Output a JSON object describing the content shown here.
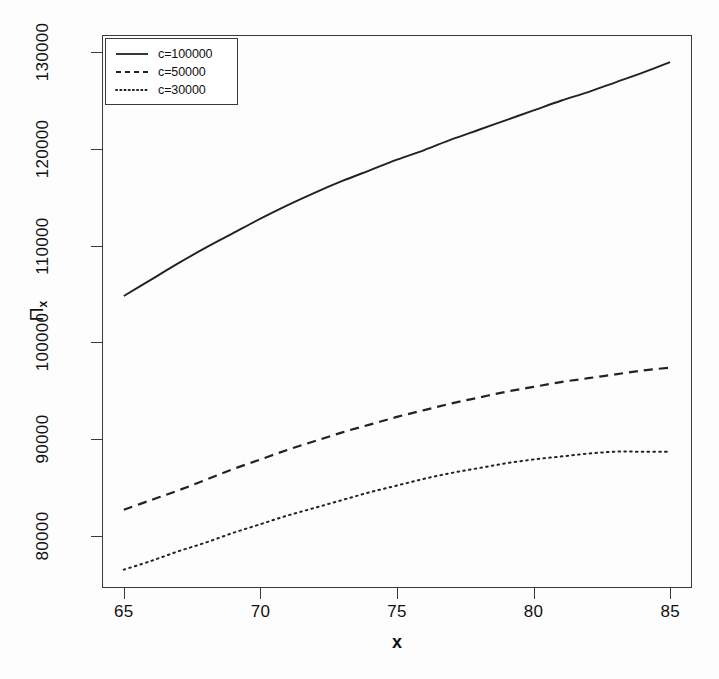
{
  "chart_data": {
    "type": "line",
    "title": "",
    "subtitle": "",
    "xlabel": "x",
    "ylabel": "Π",
    "ylabel_subscript": "x",
    "xlim": [
      64.2,
      85.8
    ],
    "ylim": [
      74600,
      131800
    ],
    "xticks": [
      65,
      70,
      75,
      80,
      85
    ],
    "yticks": [
      80000,
      90000,
      100000,
      110000,
      120000,
      130000
    ],
    "xtick_labels": [
      "65",
      "70",
      "75",
      "80",
      "85"
    ],
    "ytick_labels": [
      "80000",
      "90000",
      "100000",
      "110000",
      "120000",
      "130000"
    ],
    "grid": false,
    "legend_position": "top-left",
    "x": [
      65,
      66,
      67,
      68,
      69,
      70,
      71,
      72,
      73,
      74,
      75,
      76,
      77,
      78,
      79,
      80,
      81,
      82,
      83,
      84,
      85
    ],
    "series": [
      {
        "name": "c=100000",
        "label": "c=100000",
        "style": "solid",
        "color": "#222222",
        "values": [
          104800,
          106500,
          108200,
          109800,
          111300,
          112800,
          114200,
          115500,
          116700,
          117800,
          118900,
          119900,
          121000,
          122000,
          123000,
          124000,
          125000,
          125900,
          126900,
          127900,
          129000
        ]
      },
      {
        "name": "c=50000",
        "label": "c=50000",
        "style": "dashed",
        "color": "#222222",
        "values": [
          82700,
          83700,
          84700,
          85800,
          86900,
          87900,
          88900,
          89800,
          90700,
          91500,
          92300,
          93000,
          93700,
          94300,
          94900,
          95400,
          95900,
          96300,
          96700,
          97100,
          97400
        ]
      },
      {
        "name": "c=30000",
        "label": "c=30000",
        "style": "dotted",
        "color": "#222222",
        "values": [
          76500,
          77400,
          78400,
          79300,
          80300,
          81200,
          82100,
          82900,
          83700,
          84500,
          85200,
          85900,
          86500,
          87000,
          87500,
          87900,
          88200,
          88500,
          88700,
          88700,
          88700
        ]
      }
    ]
  },
  "legend": {
    "items": [
      {
        "label": "c=100000",
        "style": "solid"
      },
      {
        "label": "c=50000",
        "style": "dashed"
      },
      {
        "label": "c=30000",
        "style": "dotted"
      }
    ]
  },
  "axis": {
    "x_title": "x",
    "y_title_base": "Π",
    "y_title_sub": "x"
  }
}
